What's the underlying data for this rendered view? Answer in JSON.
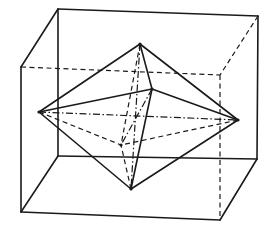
{
  "figure": {
    "colors": {
      "background": "#ffffff",
      "line": "#1a1a1a"
    },
    "styles": {
      "solid": "visible edge",
      "dashed": "hidden edge",
      "dashdot": "axis"
    }
  },
  "cube": {
    "vertices": {
      "front_top_left": [
        58,
        9
      ],
      "front_top_right": [
        258,
        16
      ],
      "front_bottom_right": [
        257,
        159
      ],
      "front_bottom_left": [
        58,
        156
      ],
      "back_top_left": [
        21,
        67
      ],
      "back_top_right": [
        220,
        75
      ],
      "back_bottom_right": [
        220,
        220
      ],
      "back_bottom_left": [
        21,
        212
      ]
    },
    "edges": [
      {
        "from": "front_top_left",
        "to": "front_top_right",
        "style": "solid"
      },
      {
        "from": "front_top_right",
        "to": "front_bottom_right",
        "style": "solid"
      },
      {
        "from": "front_bottom_right",
        "to": "front_bottom_left",
        "style": "solid"
      },
      {
        "from": "front_bottom_left",
        "to": "front_top_left",
        "style": "solid"
      },
      {
        "from": "back_top_left",
        "to": "back_bottom_left",
        "style": "solid"
      },
      {
        "from": "back_bottom_left",
        "to": "back_bottom_right",
        "style": "solid"
      },
      {
        "from": "front_top_left",
        "to": "back_top_left",
        "style": "solid"
      },
      {
        "from": "front_bottom_left",
        "to": "back_bottom_left",
        "style": "solid"
      },
      {
        "from": "front_bottom_right",
        "to": "back_bottom_right",
        "style": "solid"
      },
      {
        "from": "back_top_left",
        "to": "back_top_right",
        "style": "dashed"
      },
      {
        "from": "back_top_right",
        "to": "back_bottom_right",
        "style": "dashed"
      },
      {
        "from": "front_top_right",
        "to": "back_top_right",
        "style": "dashed"
      }
    ]
  },
  "octahedron": {
    "vertices": {
      "top": [
        140,
        44
      ],
      "bottom": [
        131,
        189
      ],
      "left": [
        39,
        112
      ],
      "right": [
        238,
        120
      ],
      "front": [
        152,
        89
      ],
      "back": [
        121,
        145
      ]
    },
    "edges": [
      {
        "from": "top",
        "to": "left",
        "style": "solid"
      },
      {
        "from": "top",
        "to": "right",
        "style": "solid"
      },
      {
        "from": "top",
        "to": "front",
        "style": "solid"
      },
      {
        "from": "bottom",
        "to": "left",
        "style": "solid"
      },
      {
        "from": "bottom",
        "to": "right",
        "style": "solid"
      },
      {
        "from": "bottom",
        "to": "front",
        "style": "solid"
      },
      {
        "from": "left",
        "to": "front",
        "style": "solid"
      },
      {
        "from": "right",
        "to": "front",
        "style": "solid"
      },
      {
        "from": "top",
        "to": "back",
        "style": "dashed"
      },
      {
        "from": "bottom",
        "to": "back",
        "style": "dashed"
      },
      {
        "from": "left",
        "to": "back",
        "style": "dashed"
      },
      {
        "from": "right",
        "to": "back",
        "style": "dashed"
      }
    ],
    "axes": [
      {
        "from": "left",
        "to": "right",
        "style": "dashdot"
      },
      {
        "from": "top",
        "to": "bottom",
        "style": "dashdot"
      },
      {
        "from": "front",
        "to": "back",
        "style": "dashdot"
      }
    ]
  }
}
